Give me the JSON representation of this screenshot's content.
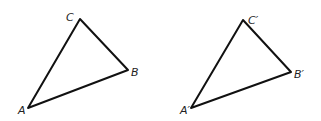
{
  "diagram": {
    "triangles": [
      {
        "id": "original",
        "vertices": {
          "A": {
            "x": 28,
            "y": 108,
            "label": "A",
            "lx": 18,
            "ly": 114
          },
          "B": {
            "x": 128,
            "y": 70,
            "label": "B",
            "lx": 131,
            "ly": 76
          },
          "C": {
            "x": 80,
            "y": 19,
            "label": "C",
            "lx": 66,
            "ly": 21
          }
        }
      },
      {
        "id": "image",
        "vertices": {
          "A": {
            "x": 191,
            "y": 108,
            "label": "A′",
            "lx": 180,
            "ly": 114
          },
          "B": {
            "x": 291,
            "y": 72,
            "label": "B′",
            "lx": 294,
            "ly": 78
          },
          "C": {
            "x": 243,
            "y": 20,
            "label": "C′",
            "lx": 248,
            "ly": 24
          }
        }
      }
    ],
    "colors": {
      "stroke": "#111111",
      "background": "#ffffff"
    }
  }
}
